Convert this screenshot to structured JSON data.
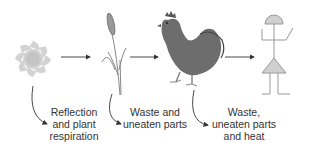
{
  "diagram": {
    "type": "energy-flow-food-chain",
    "nodes": [
      {
        "id": "sun",
        "name": "Sun"
      },
      {
        "id": "plant",
        "name": "Grain plant"
      },
      {
        "id": "chicken",
        "name": "Chicken"
      },
      {
        "id": "human",
        "name": "Human"
      }
    ],
    "flows": [
      {
        "from": "sun",
        "to": "plant"
      },
      {
        "from": "plant",
        "to": "chicken"
      },
      {
        "from": "chicken",
        "to": "human"
      }
    ],
    "losses": [
      {
        "from": "sun",
        "line1": "Reflection",
        "line2": "and plant",
        "line3": "respiration"
      },
      {
        "from": "plant",
        "line1": "Waste and",
        "line2": "uneaten parts"
      },
      {
        "from": "chicken",
        "line1": "Waste,",
        "line2": "uneaten parts",
        "line3": "and heat"
      }
    ],
    "colors": {
      "arrow": "#333333",
      "sun": "#c8c8c8",
      "chicken": "#6e6e6e",
      "human_fill": "#cfcfcf",
      "human_line": "#999999"
    }
  }
}
